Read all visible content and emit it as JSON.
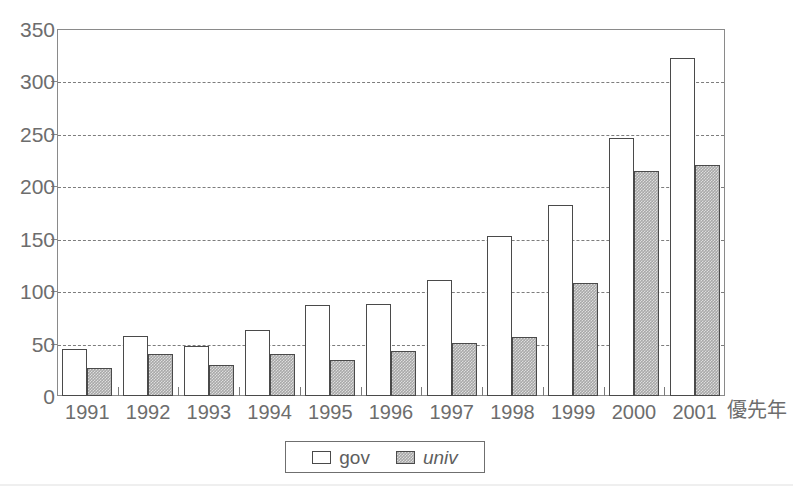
{
  "title": "",
  "chart_data": {
    "type": "bar",
    "title": "",
    "subtitle": "",
    "xlabel": "優先年",
    "ylabel": "",
    "categories": [
      "1991",
      "1992",
      "1993",
      "1994",
      "1995",
      "1996",
      "1997",
      "1998",
      "1999",
      "2000",
      "2001"
    ],
    "series": [
      {
        "name": "gov",
        "style": "white-outline",
        "values": [
          45,
          57,
          48,
          63,
          87,
          88,
          111,
          153,
          182,
          246,
          322
        ]
      },
      {
        "name": "univ",
        "style": "gray-hatched",
        "values": [
          27,
          40,
          30,
          40,
          34,
          43,
          51,
          56,
          108,
          215,
          220
        ]
      }
    ],
    "ylim": [
      0,
      350
    ],
    "ytick_values": [
      0,
      50,
      100,
      150,
      200,
      250,
      300,
      350
    ],
    "ytick_labels": [
      "0",
      "50",
      "100",
      "150",
      "200",
      "250",
      "300",
      "350"
    ],
    "grid": "horizontal-dashed",
    "legend_position": "bottom-center",
    "legend": [
      {
        "label": "gov",
        "swatch": "white-square",
        "italic": false
      },
      {
        "label": "univ",
        "swatch": "gray-square",
        "italic": true
      }
    ],
    "colors": {
      "gov_fill": "#ffffff",
      "univ_fill": "#a8a8a8",
      "bar_outline": "#4a4a4a",
      "axis": "#8a8a8a",
      "gridline": "#7d7d7d",
      "text": "#6d6d6d"
    }
  }
}
